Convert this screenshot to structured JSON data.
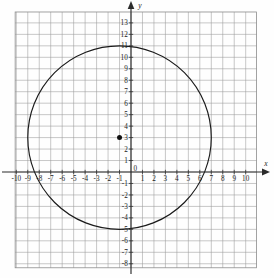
{
  "figure": {
    "title": "",
    "background_color": "#fefefe",
    "grid_color": "#9a9a9a",
    "axis_color": "#2b2b2b",
    "curve_color": "#1a1a1a"
  },
  "axes": {
    "x_axis_label": "x",
    "y_axis_label": "y",
    "x_tick_labels": [
      "-10",
      "-9",
      "-8",
      "-7",
      "-6",
      "-5",
      "-4",
      "-3",
      "-2",
      "-1",
      "0",
      "1",
      "2",
      "3",
      "4",
      "5",
      "6",
      "7",
      "8",
      "9",
      "10"
    ],
    "y_tick_labels": [
      "13",
      "12",
      "11",
      "10",
      "9",
      "8",
      "7",
      "6",
      "5",
      "4",
      "3",
      "2",
      "1",
      "-1",
      "-2",
      "-3",
      "-4",
      "-5",
      "-6",
      "-7",
      "-8"
    ],
    "origin_label": "0"
  },
  "chart_data": {
    "type": "scatter",
    "title": "",
    "xlabel": "x",
    "ylabel": "y",
    "grid": true,
    "legend": false,
    "xlim": [
      -10,
      10
    ],
    "ylim": [
      -8,
      13
    ],
    "xticks": [
      -10,
      -9,
      -8,
      -7,
      -6,
      -5,
      -4,
      -3,
      -2,
      -1,
      0,
      1,
      2,
      3,
      4,
      5,
      6,
      7,
      8,
      9,
      10
    ],
    "yticks": [
      -8,
      -7,
      -6,
      -5,
      -4,
      -3,
      -2,
      -1,
      0,
      1,
      2,
      3,
      4,
      5,
      6,
      7,
      8,
      9,
      10,
      11,
      12,
      13
    ],
    "grid_step": 1,
    "shapes": [
      {
        "kind": "circle",
        "center": [
          -1,
          3
        ],
        "radius": 8,
        "stroke": "#1a1a1a",
        "fill": "none",
        "equation": "(x + 1)^2 + (y - 3)^2 = 64",
        "top_point": [
          -1,
          11
        ],
        "bottom_point": [
          -1,
          -5
        ],
        "left_point": [
          -9,
          3
        ],
        "right_point": [
          7,
          3
        ]
      }
    ],
    "points": [
      {
        "label": "center",
        "x": -1,
        "y": 3,
        "marker": "filled-circle",
        "color": "#111111"
      }
    ]
  }
}
